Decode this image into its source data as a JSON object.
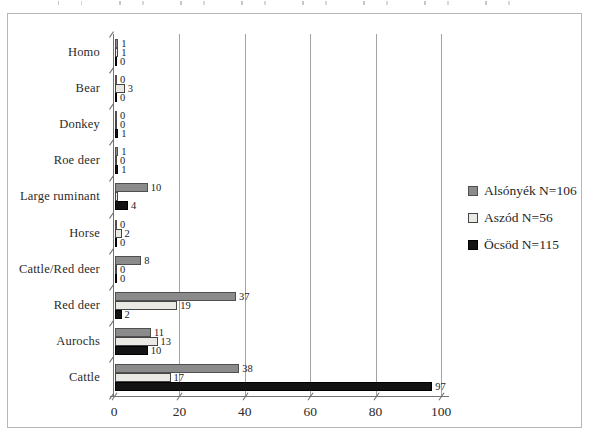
{
  "figure": {
    "background": "#ffffff",
    "frame_border_color": "#b7b7b7",
    "gridline_color": "#a3a3a3",
    "axis_color": "#737373",
    "text_color": "#262626"
  },
  "chart_data": {
    "type": "bar",
    "orientation": "horizontal",
    "title": "",
    "xlabel": "",
    "ylabel": "",
    "xlim": [
      0,
      100
    ],
    "xticks": [
      0,
      20,
      40,
      60,
      80,
      100
    ],
    "grid": "vertical gridlines at every x tick, slanted tick marks on both axes",
    "legend_position": "right",
    "categories": [
      "Homo",
      "Bear",
      "Donkey",
      "Roe deer",
      "Large ruminant",
      "Horse",
      "Cattle/Red deer",
      "Red deer",
      "Aurochs",
      "Cattle"
    ],
    "series": [
      {
        "name": "Alsónyék N=106",
        "slug": "alsonyek",
        "color": "#8b8b8b",
        "border_color": "#4f4f4f",
        "values": [
          1,
          0,
          0,
          1,
          10,
          0,
          8,
          37,
          11,
          38
        ],
        "labels": [
          "1",
          "0",
          "0",
          "1",
          "10",
          "0",
          "8",
          "37",
          "11",
          "38"
        ]
      },
      {
        "name": "Aszód N=56",
        "slug": "aszod",
        "color": "#eae9e4",
        "border_color": "#454545",
        "values": [
          1,
          3,
          0,
          0,
          1,
          2,
          0,
          19,
          13,
          17
        ],
        "labels": [
          "1",
          "3",
          "0",
          "0",
          "",
          "2",
          "0",
          "19",
          "13",
          "17"
        ]
      },
      {
        "name": "Öcsöd N=115",
        "slug": "ocsod",
        "color": "#131313",
        "border_color": "#000000",
        "values": [
          0,
          0,
          1,
          1,
          4,
          0,
          0,
          2,
          10,
          97
        ],
        "labels": [
          "0",
          "0",
          "1",
          "1",
          "4",
          "0",
          "0",
          "2",
          "10",
          "97"
        ]
      }
    ]
  }
}
